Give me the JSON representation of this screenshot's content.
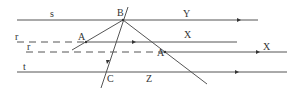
{
  "diagram": {
    "type": "geometric optics / ray diagram",
    "lines": [
      {
        "name": "s",
        "style": "solid",
        "direction": "right"
      },
      {
        "name": "r",
        "style": "dashed"
      },
      {
        "name": "r",
        "style": "dashed"
      },
      {
        "name": "t",
        "style": "solid",
        "direction": "right"
      }
    ],
    "labels": {
      "s": "s",
      "r_top": "r",
      "r_lower": "r",
      "t": "t",
      "B": "B",
      "Y": "Y",
      "A_left": "A",
      "X_mid": "X",
      "A_right": "A",
      "X_right": "X",
      "C": "C",
      "Z": "Z"
    },
    "points": [
      "B",
      "A",
      "A",
      "C"
    ],
    "colors": {
      "line": "#555555",
      "text": "#333333",
      "background": "#ffffff"
    }
  }
}
